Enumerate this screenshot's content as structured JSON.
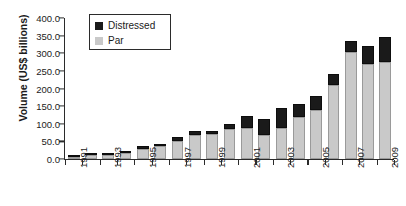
{
  "chart_data": {
    "type": "bar",
    "barmode": "stacked",
    "title": "",
    "xlabel": "",
    "ylabel": "Volume (US$ billions)",
    "ylim": [
      0,
      400
    ],
    "ytick_step": 50,
    "ytick_labels": [
      "400.0",
      "350.0",
      "300.0",
      "250.0",
      "200.0",
      "150.0",
      "100.0",
      "50.0",
      "0.0"
    ],
    "ytick_values": [
      400,
      350,
      300,
      250,
      200,
      150,
      100,
      50,
      0
    ],
    "grid": false,
    "legend_position": "top-left",
    "categories": [
      "1991",
      "1992",
      "1993",
      "1994",
      "1995",
      "1996",
      "1997",
      "1998",
      "1999",
      "2000",
      "2001",
      "2002",
      "2003",
      "2004",
      "2005",
      "2006",
      "2007",
      "2008",
      "2009"
    ],
    "xtick_labels_shown": [
      "1991",
      "1993",
      "1995",
      "1997",
      "1999",
      "2001",
      "2003",
      "2005",
      "2007",
      "2009"
    ],
    "series": [
      {
        "name": "Par",
        "color": "#c9c9c9",
        "values": [
          6,
          10,
          11,
          16,
          29,
          36,
          52,
          68,
          70,
          85,
          88,
          68,
          88,
          118,
          140,
          210,
          305,
          270,
          275
        ]
      },
      {
        "name": "Distressed",
        "color": "#1a1a1a",
        "values": [
          3,
          3,
          5,
          6,
          7,
          7,
          11,
          11,
          9,
          15,
          33,
          45,
          57,
          38,
          38,
          32,
          30,
          50,
          70
        ]
      }
    ],
    "totals": [
      9,
      13,
      16,
      22,
      36,
      43,
      63,
      79,
      79,
      100,
      121,
      113,
      145,
      156,
      178,
      242,
      335,
      320,
      345
    ]
  },
  "legend": {
    "entries": [
      {
        "label": "Distressed",
        "color": "#1a1a1a"
      },
      {
        "label": "Par",
        "color": "#c9c9c9"
      }
    ]
  }
}
